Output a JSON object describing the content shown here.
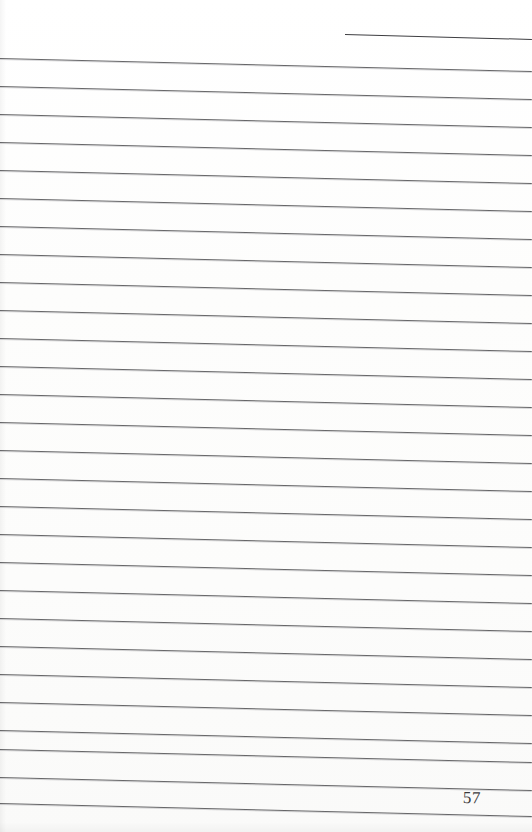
{
  "document": {
    "type": "scanned-ruled-manuscript-page",
    "page_number": "57",
    "page_width": 532,
    "page_height": 832,
    "background_color": "#fefefe",
    "rule_color": "#5a5a5c",
    "text_color": "#3a3a3c",
    "content_text": "",
    "notes": "Blank lined page; no handwriting or printed body text visible."
  },
  "ruling": {
    "line_count": 28,
    "first_line_y": 58,
    "line_spacing": 28,
    "line_thickness": 1,
    "slant_degrees": 1.4,
    "left_x": 0,
    "right_x": 532,
    "lines": [
      {
        "index": 1,
        "y_left": 58,
        "y_right": 71
      },
      {
        "index": 2,
        "y_left": 86,
        "y_right": 99
      },
      {
        "index": 3,
        "y_left": 114,
        "y_right": 127
      },
      {
        "index": 4,
        "y_left": 142,
        "y_right": 155
      },
      {
        "index": 5,
        "y_left": 170,
        "y_right": 183
      },
      {
        "index": 6,
        "y_left": 198,
        "y_right": 211
      },
      {
        "index": 7,
        "y_left": 226,
        "y_right": 239
      },
      {
        "index": 8,
        "y_left": 254,
        "y_right": 267
      },
      {
        "index": 9,
        "y_left": 282,
        "y_right": 295
      },
      {
        "index": 10,
        "y_left": 310,
        "y_right": 323
      },
      {
        "index": 11,
        "y_left": 338,
        "y_right": 351
      },
      {
        "index": 12,
        "y_left": 366,
        "y_right": 379
      },
      {
        "index": 13,
        "y_left": 394,
        "y_right": 407
      },
      {
        "index": 14,
        "y_left": 422,
        "y_right": 435
      },
      {
        "index": 15,
        "y_left": 450,
        "y_right": 463
      },
      {
        "index": 16,
        "y_left": 478,
        "y_right": 491
      },
      {
        "index": 17,
        "y_left": 506,
        "y_right": 519
      },
      {
        "index": 18,
        "y_left": 534,
        "y_right": 547
      },
      {
        "index": 19,
        "y_left": 562,
        "y_right": 575
      },
      {
        "index": 20,
        "y_left": 590,
        "y_right": 603
      },
      {
        "index": 21,
        "y_left": 618,
        "y_right": 631
      },
      {
        "index": 22,
        "y_left": 646,
        "y_right": 659
      },
      {
        "index": 23,
        "y_left": 674,
        "y_right": 687
      },
      {
        "index": 24,
        "y_left": 702,
        "y_right": 715
      },
      {
        "index": 25,
        "y_left": 730,
        "y_right": 743
      },
      {
        "index": 26,
        "y_left": 749,
        "y_right": 762
      },
      {
        "index": 27,
        "y_left": 777,
        "y_right": 790
      },
      {
        "index": 28,
        "y_left": 803,
        "y_right": 816
      }
    ]
  },
  "partial_rule": {
    "label": "short-top-right-rule",
    "x_start": 345,
    "x_end": 532,
    "y_left": 34,
    "y_right": 39
  },
  "page_number_block": {
    "value": "57",
    "x": 463,
    "y": 789,
    "font_size_px": 17,
    "align": "right"
  }
}
